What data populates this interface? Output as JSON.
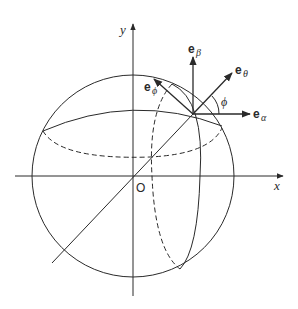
{
  "diagram": {
    "axes": {
      "x_label": "x",
      "y_label": "y",
      "origin_label": "O"
    },
    "vectors": {
      "e_beta": {
        "base": "e",
        "sub": "β"
      },
      "e_theta": {
        "base": "e",
        "sub": "θ"
      },
      "e_alpha": {
        "base": "e",
        "sub": "α"
      },
      "e_phi": {
        "base": "e",
        "sub": "ϕ"
      }
    },
    "angle_label": "ϕ",
    "colors": {
      "stroke": "#2a2a2a",
      "background": "#ffffff"
    }
  }
}
